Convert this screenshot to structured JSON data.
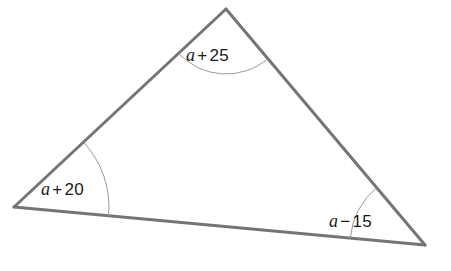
{
  "figure": {
    "background_color": "#ffffff",
    "side_color": "#757575",
    "side_width": 3,
    "arc_color": "#9a9a9a",
    "arc_width": 1,
    "text_color": "#1a1a1a"
  },
  "vertices": {
    "apex": {
      "name": "apex-vertex",
      "x": 226,
      "y": 9
    },
    "left": {
      "name": "left-vertex",
      "x": 14,
      "y": 207
    },
    "right": {
      "name": "right-vertex",
      "x": 425,
      "y": 245
    }
  },
  "sides": [
    {
      "name": "side-left",
      "from": "left",
      "to": "apex"
    },
    {
      "name": "side-right",
      "from": "apex",
      "to": "right"
    },
    {
      "name": "side-base",
      "from": "left",
      "to": "right"
    }
  ],
  "angles": [
    {
      "id": "apex",
      "position": "top",
      "arc_radius": 65,
      "label": {
        "variable": "a",
        "operator": "+",
        "constant": "25"
      },
      "label_text": "a + 25"
    },
    {
      "id": "left",
      "position": "bottom-left",
      "arc_radius": 95,
      "label": {
        "variable": "a",
        "operator": "+",
        "constant": "20"
      },
      "label_text": "a + 20"
    },
    {
      "id": "right",
      "position": "bottom-right",
      "arc_radius": 75,
      "label": {
        "variable": "a",
        "operator": "−",
        "constant": "15"
      },
      "label_text": "a − 15"
    }
  ]
}
